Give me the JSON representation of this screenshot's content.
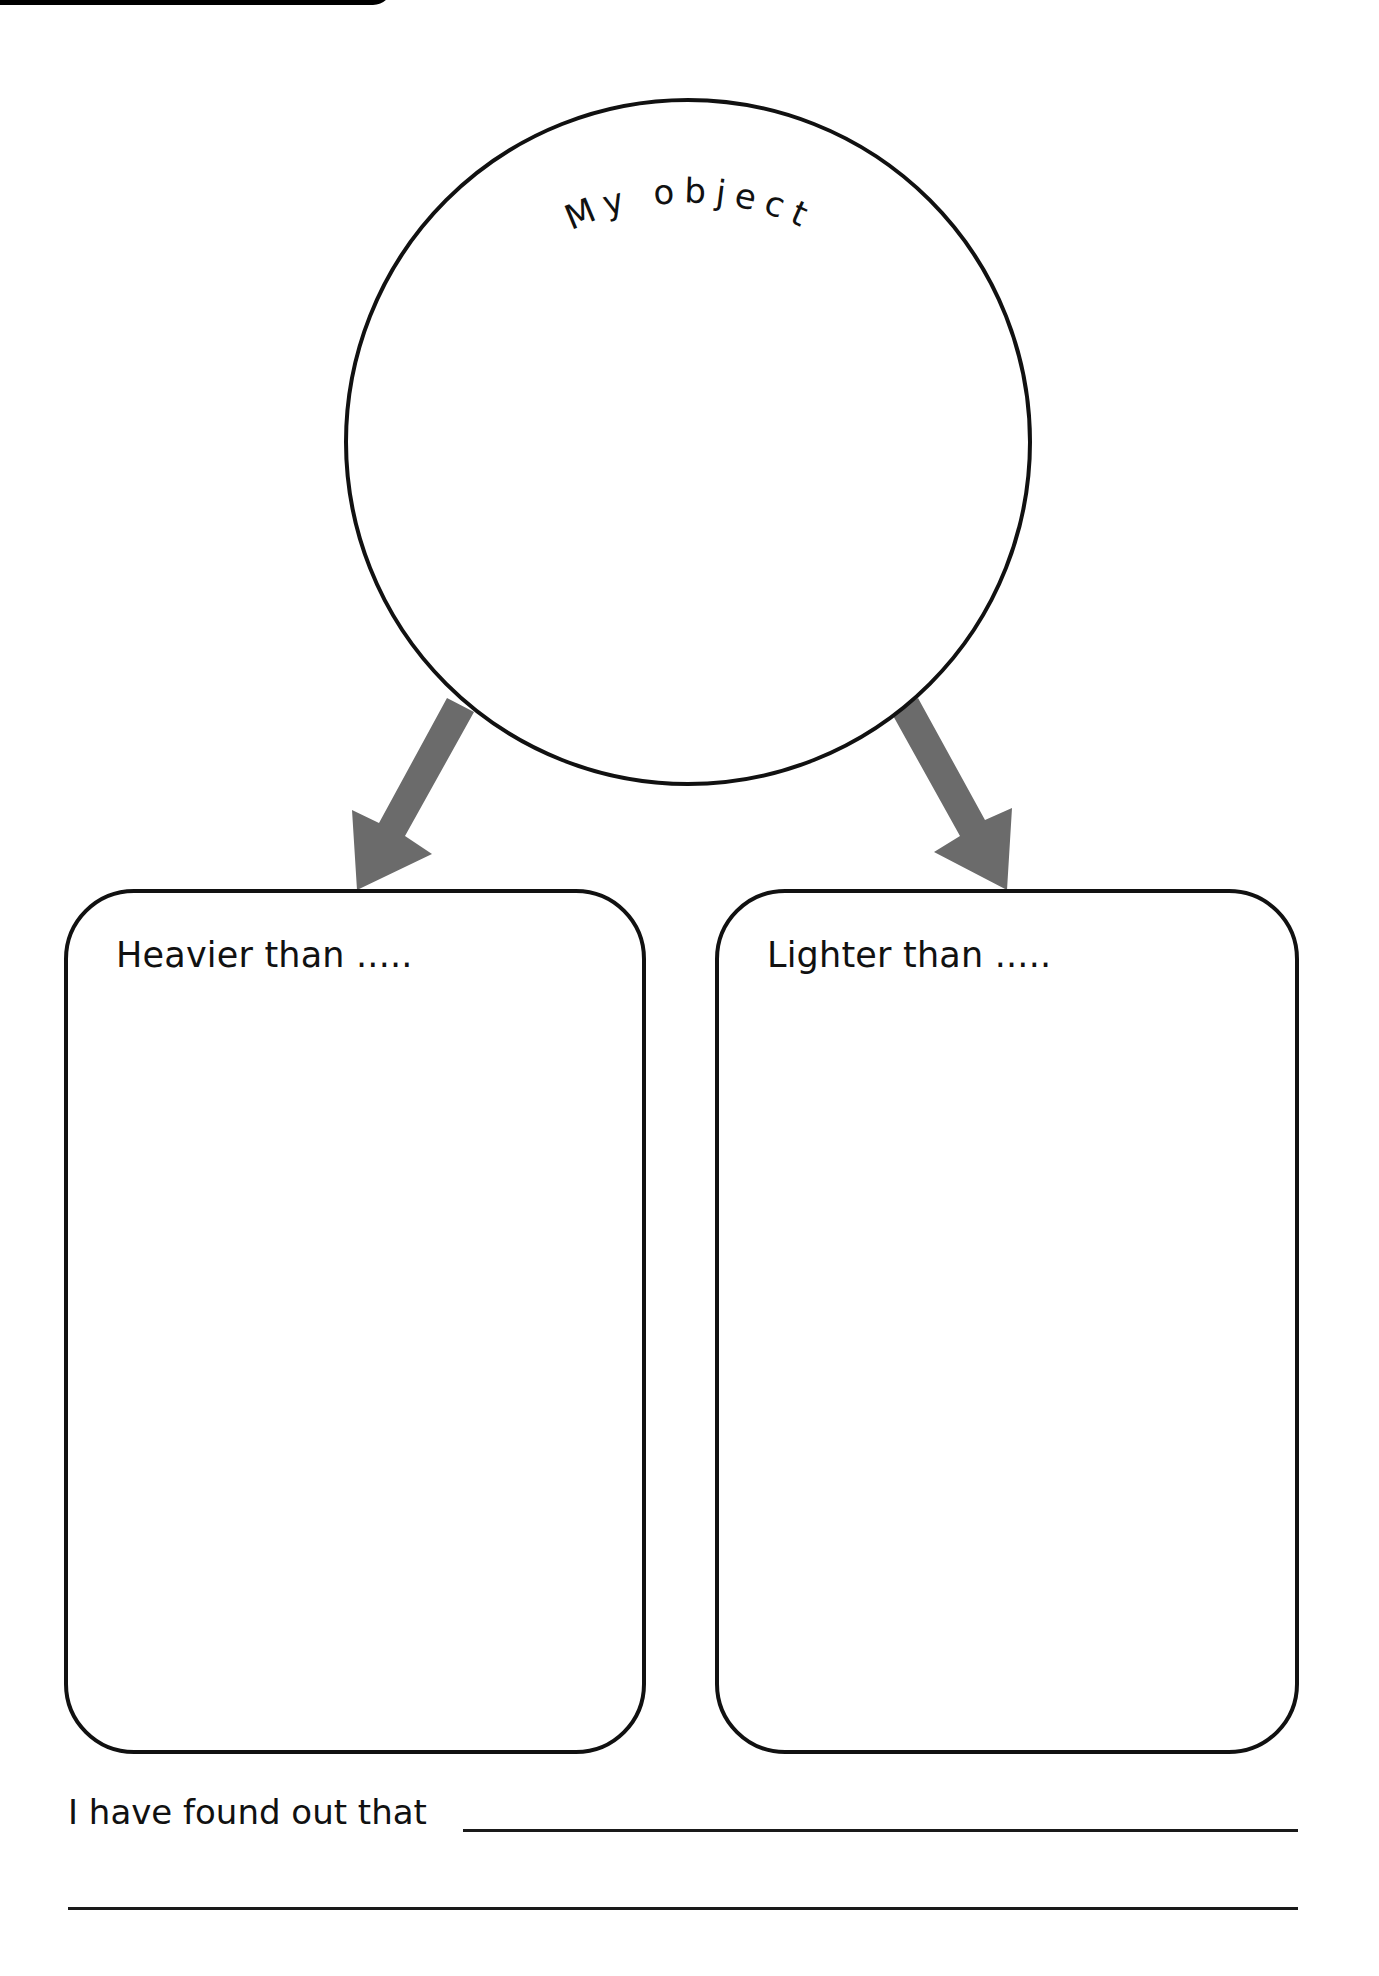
{
  "worksheet": {
    "circle": {
      "label": "My object",
      "center_x": 688,
      "center_y": 442,
      "radius": 342
    },
    "arrows": [
      {
        "direction": "down-left",
        "points_to": "heavier_box"
      },
      {
        "direction": "down-right",
        "points_to": "lighter_box"
      }
    ],
    "boxes": [
      {
        "id": "heavier_box",
        "label": "Heavier than ....."
      },
      {
        "id": "lighter_box",
        "label": "Lighter than ....."
      }
    ],
    "conclusion": {
      "prompt": "I have found out that",
      "answer_lines": 2
    },
    "colors": {
      "ink": "#111111",
      "arrow": "#6b6b6b",
      "background": "#ffffff"
    }
  }
}
